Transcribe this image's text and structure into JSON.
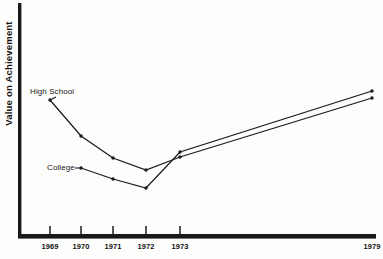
{
  "figure": {
    "background_color": "#fdfdfc",
    "ink_color": "#1a1a1a"
  },
  "axes": {
    "y_axis_title": "Value on Achievement",
    "x_axis_title": ""
  },
  "labels": {
    "high_school": "High School",
    "college": "College"
  },
  "chart_data": {
    "type": "line",
    "title": "",
    "subtitle": "",
    "xlabel": "",
    "ylabel": "Value on Achievement",
    "grid": false,
    "legend": "inline-annotations",
    "x": [
      "1969",
      "1970",
      "1971",
      "1972",
      "1973",
      "1979"
    ],
    "tick_labels": [
      "1969",
      "1970",
      "1971",
      "1972",
      "1973",
      "1979"
    ],
    "ticks_drawn": [
      "1969",
      "1970",
      "1971",
      "1972",
      "1973"
    ],
    "xlim": [
      1969,
      1979
    ],
    "ylim": [
      0,
      100
    ],
    "y_axis_tick_labels": [],
    "series": [
      {
        "name": "High School",
        "values": [
          72,
          58,
          48,
          44,
          51,
          80
        ],
        "marker": "dot",
        "color": "#1a1a1a"
      },
      {
        "name": "College",
        "values": [
          45,
          41,
          38,
          31,
          53,
          84
        ],
        "marker": "dot",
        "color": "#1a1a1a"
      }
    ],
    "annotations": [
      {
        "text": "High School",
        "series": "High School",
        "points_to": "1969"
      },
      {
        "text": "College",
        "series": "College",
        "points_to": "1969"
      }
    ]
  },
  "geometry": {
    "plot": {
      "x0": 21,
      "y0": 3,
      "x1": 376,
      "y1": 236
    },
    "tick_x": [
      50,
      81,
      113,
      146,
      180,
      372
    ],
    "series_pixels": {
      "high_school": [
        [
          50,
          100
        ],
        [
          81,
          136
        ],
        [
          113,
          158
        ],
        [
          146,
          170
        ],
        [
          180,
          157
        ],
        [
          372,
          98
        ]
      ],
      "college": [
        [
          81,
          168
        ],
        [
          113,
          179
        ],
        [
          146,
          188
        ],
        [
          180,
          152
        ],
        [
          372,
          91
        ]
      ]
    }
  }
}
